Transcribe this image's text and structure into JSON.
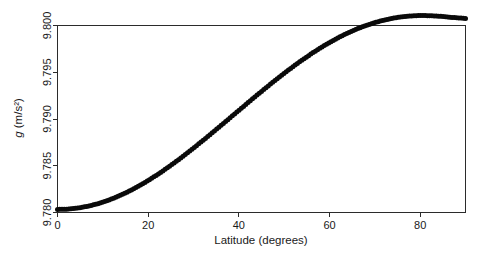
{
  "chart_data": {
    "type": "scatter",
    "title": "",
    "subtitle": "",
    "xlabel": "Latitude (degrees)",
    "ylabel": "g (m/s²)",
    "ylabel_italic_prefix": "g",
    "ylabel_rest": " (m/s²)",
    "xlim": [
      0,
      90
    ],
    "ylim": [
      9.78,
      9.8
    ],
    "grid": false,
    "legend": null,
    "legend_position": "none",
    "marker": "filled-circle",
    "marker_color": "#0a0a0a",
    "xticks": [
      0,
      20,
      40,
      60,
      80
    ],
    "xtick_labels": [
      "0",
      "20",
      "40",
      "60",
      "80"
    ],
    "yticks": [
      9.78,
      9.785,
      9.79,
      9.795,
      9.8
    ],
    "ytick_labels": [
      "9.780",
      "9.785",
      "9.790",
      "9.795",
      "9.800"
    ],
    "series": [
      {
        "name": "International Gravity Formula",
        "x": [
          0,
          1,
          2,
          3,
          4,
          5,
          6,
          7,
          8,
          9,
          10,
          11,
          12,
          13,
          14,
          15,
          16,
          17,
          18,
          19,
          20,
          21,
          22,
          23,
          24,
          25,
          26,
          27,
          28,
          29,
          30,
          31,
          32,
          33,
          34,
          35,
          36,
          37,
          38,
          39,
          40,
          41,
          42,
          43,
          44,
          45,
          46,
          47,
          48,
          49,
          50,
          51,
          52,
          53,
          54,
          55,
          56,
          57,
          58,
          59,
          60,
          61,
          62,
          63,
          64,
          65,
          66,
          67,
          68,
          69,
          70,
          71,
          72,
          73,
          74,
          75,
          76,
          77,
          78,
          79,
          80,
          81,
          82,
          83,
          84,
          85,
          86,
          87,
          88,
          89,
          90
        ],
        "values": [
          9.78033,
          9.78034,
          9.78039,
          9.78047,
          9.78058,
          9.78072,
          9.7809,
          9.78111,
          9.78135,
          9.78163,
          9.78193,
          9.78227,
          9.78264,
          9.78304,
          9.78347,
          9.78393,
          9.78442,
          9.78493,
          9.78548,
          9.78605,
          9.78664,
          9.78727,
          9.78791,
          9.78858,
          9.78927,
          9.78998,
          9.79071,
          9.79146,
          9.79222,
          9.793,
          9.7938,
          9.79461,
          9.79543,
          9.79626,
          9.7971,
          9.79795,
          9.7988,
          9.79966,
          9.80053,
          9.80139,
          9.80226,
          9.80313,
          9.80399,
          9.80486,
          9.80572,
          9.80657,
          9.80742,
          9.80826,
          9.80909,
          9.80991,
          9.81072,
          9.81151,
          9.81229,
          9.81306,
          9.81381,
          9.81454,
          9.81525,
          9.81594,
          9.81661,
          9.81726,
          9.81789,
          9.81849,
          9.81907,
          9.81962,
          9.82015,
          9.82065,
          9.82113,
          9.82157,
          9.82199,
          9.82238,
          9.82274,
          9.82307,
          9.82337,
          9.82364,
          9.82388,
          9.82409,
          9.82427,
          9.82441,
          9.82453,
          9.82461,
          9.82466,
          9.82468,
          9.82468,
          9.82464,
          9.82458,
          9.8245,
          9.8244,
          9.82429,
          9.82418,
          9.82408,
          9.824
        ]
      }
    ],
    "plotted_values_note": "Values rendered on the 9.780-9.800 axis range",
    "plot_series_scaled": [
      9.78033,
      9.78034,
      9.78036,
      9.7804,
      9.78045,
      9.78052,
      9.78061,
      9.78071,
      9.78083,
      9.78096,
      9.78111,
      9.78128,
      9.78146,
      9.78166,
      9.78187,
      9.78209,
      9.78233,
      9.78259,
      9.78285,
      9.78313,
      9.78343,
      9.78373,
      9.78404,
      9.78437,
      9.7847,
      9.78505,
      9.7854,
      9.78576,
      9.78613,
      9.78651,
      9.78689,
      9.78728,
      9.78767,
      9.78807,
      9.78847,
      9.78888,
      9.78928,
      9.78969,
      9.7901,
      9.79051,
      9.79092,
      9.79133,
      9.79174,
      9.79215,
      9.79255,
      9.79295,
      9.79335,
      9.79374,
      9.79413,
      9.79451,
      9.79489,
      9.79526,
      9.79562,
      9.79597,
      9.79632,
      9.79665,
      9.79698,
      9.7973,
      9.7976,
      9.7979,
      9.79818,
      9.79845,
      9.79871,
      9.79896,
      9.79919,
      9.79941,
      9.79962,
      9.79981,
      9.79999,
      9.80016,
      9.80031,
      9.80045,
      9.80057,
      9.80068,
      9.80078,
      9.80086,
      9.80093,
      9.80098,
      9.80102,
      9.80105,
      9.80106,
      9.80106,
      9.80105,
      9.80103,
      9.801,
      9.80096,
      9.80092,
      9.80087,
      9.80083,
      9.80079,
      9.80076
    ]
  },
  "figure": {
    "background_color": "#ffffff",
    "axis_color": "#2b2b2b",
    "marker_color": "#0a0a0a"
  }
}
